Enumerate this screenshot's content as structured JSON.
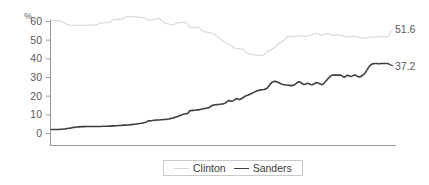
{
  "chart_data": {
    "type": "line",
    "title": "",
    "subtitle": "",
    "xlabel": "",
    "ylabel": "%",
    "ylim": [
      0,
      65
    ],
    "yticks": [
      0,
      10,
      20,
      30,
      40,
      50,
      60
    ],
    "ytick_labels": [
      "0",
      "10",
      "20",
      "30",
      "40",
      "50",
      "60"
    ],
    "xticks": [],
    "xtick_labels": [],
    "grid": false,
    "legend_position": "bottom-center",
    "legend": [
      "Clinton",
      "Sanders"
    ],
    "end_labels": {
      "clinton": "51.6",
      "sanders": "37.2"
    },
    "series": [
      {
        "name": "Clinton",
        "color": "#dcdcdc",
        "end_value": 51.6,
        "values": [
          60.2,
          60.2,
          60.2,
          60.2,
          60.2,
          60.1,
          60.0,
          59.6,
          59.0,
          58.6,
          58.2,
          57.9,
          57.7,
          57.6,
          57.6,
          57.6,
          57.7,
          57.7,
          57.7,
          57.7,
          57.7,
          57.7,
          57.8,
          57.8,
          57.8,
          57.8,
          57.8,
          57.9,
          58.0,
          58.1,
          58.9,
          59.0,
          59.0,
          59.0,
          59.1,
          59.1,
          59.2,
          59.3,
          60.6,
          60.7,
          60.8,
          60.8,
          60.9,
          61.0,
          61.1,
          61.2,
          62.2,
          62.3,
          62.3,
          62.3,
          62.3,
          62.3,
          62.2,
          62.2,
          62.1,
          62.0,
          61.9,
          61.8,
          61.7,
          61.3,
          60.3,
          60.3,
          60.4,
          60.5,
          61.0,
          61.2,
          61.3,
          61.2,
          60.9,
          60.2,
          59.0,
          58.8,
          58.6,
          58.3,
          58.1,
          57.9,
          57.8,
          58.6,
          59.0,
          59.1,
          59.2,
          59.3,
          59.3,
          59.2,
          58.9,
          58.0,
          56.6,
          56.4,
          56.4,
          56.5,
          56.6,
          56.7,
          56.3,
          55.3,
          54.6,
          54.3,
          54.1,
          54.0,
          53.8,
          53.6,
          53.3,
          52.8,
          52.4,
          51.8,
          51.2,
          50.3,
          49.6,
          49.0,
          48.6,
          48.2,
          47.7,
          47.3,
          46.6,
          46.0,
          45.5,
          45.3,
          45.2,
          45.1,
          45.0,
          44.8,
          44.2,
          43.3,
          42.6,
          42.3,
          42.1,
          42.0,
          41.9,
          41.8,
          41.7,
          41.6,
          41.6,
          41.7,
          42.0,
          42.6,
          43.4,
          44.0,
          44.4,
          44.8,
          45.4,
          46.2,
          47.0,
          47.6,
          48.2,
          48.8,
          49.4,
          50.2,
          51.1,
          51.6,
          51.8,
          51.8,
          51.7,
          51.6,
          51.8,
          52.0,
          52.1,
          52.1,
          52.0,
          51.9,
          51.8,
          51.9,
          52.1,
          52.4,
          52.8,
          53.1,
          53.3,
          53.2,
          53.0,
          52.6,
          52.3,
          52.6,
          53.0,
          53.3,
          53.2,
          52.9,
          52.5,
          52.3,
          52.4,
          52.6,
          52.7,
          52.6,
          52.3,
          52.0,
          51.7,
          51.4,
          51.3,
          51.5,
          51.8,
          52.0,
          52.0,
          51.8,
          51.5,
          51.2,
          51.0,
          50.9,
          50.9,
          51.0,
          51.1,
          51.2,
          51.3,
          51.4,
          51.4,
          51.5,
          51.5,
          51.5,
          51.6,
          51.6,
          51.6,
          51.6,
          51.6,
          51.6
        ]
      },
      {
        "name": "Sanders",
        "color": "#3f3f3f",
        "end_value": 37.2,
        "values": [
          1.9,
          1.9,
          1.9,
          1.9,
          1.9,
          1.9,
          2.0,
          2.0,
          2.1,
          2.2,
          2.4,
          2.5,
          2.6,
          2.8,
          3.0,
          3.1,
          3.2,
          3.3,
          3.3,
          3.4,
          3.4,
          3.4,
          3.5,
          3.5,
          3.5,
          3.5,
          3.5,
          3.5,
          3.5,
          3.5,
          3.5,
          3.5,
          3.6,
          3.6,
          3.6,
          3.6,
          3.7,
          3.7,
          3.8,
          3.8,
          3.9,
          3.9,
          4.0,
          4.0,
          4.1,
          4.2,
          4.2,
          4.3,
          4.3,
          4.4,
          4.5,
          4.6,
          4.7,
          4.8,
          5.0,
          5.1,
          5.2,
          5.4,
          5.6,
          5.8,
          6.4,
          6.5,
          6.6,
          6.7,
          6.8,
          6.9,
          7.0,
          7.0,
          7.1,
          7.1,
          7.2,
          7.3,
          7.4,
          7.5,
          7.7,
          7.9,
          8.1,
          8.4,
          8.7,
          9.0,
          9.4,
          9.7,
          10.0,
          10.2,
          10.4,
          10.5,
          11.9,
          12.0,
          12.1,
          12.2,
          12.3,
          12.4,
          12.5,
          12.7,
          12.9,
          13.1,
          13.2,
          13.4,
          13.6,
          14.2,
          14.8,
          15.0,
          15.1,
          15.2,
          15.3,
          15.4,
          15.5,
          15.6,
          16.0,
          16.6,
          17.4,
          17.2,
          17.0,
          17.3,
          17.9,
          18.4,
          18.2,
          17.9,
          18.3,
          18.9,
          19.5,
          19.9,
          20.2,
          20.6,
          21.0,
          21.4,
          21.9,
          22.3,
          22.6,
          22.9,
          23.1,
          23.2,
          23.3,
          23.5,
          24.0,
          25.0,
          26.2,
          27.1,
          27.6,
          27.7,
          27.5,
          27.1,
          26.7,
          26.3,
          26.0,
          25.8,
          25.7,
          25.6,
          25.5,
          25.4,
          25.5,
          25.8,
          26.5,
          27.2,
          27.4,
          27.0,
          26.4,
          26.0,
          26.2,
          26.6,
          26.4,
          26.0,
          25.8,
          26.2,
          26.8,
          27.0,
          26.6,
          26.2,
          25.9,
          26.4,
          27.3,
          28.3,
          29.3,
          30.2,
          30.9,
          31.0,
          31.0,
          31.0,
          31.0,
          31.0,
          30.9,
          30.3,
          29.9,
          30.5,
          30.9,
          30.6,
          30.2,
          30.6,
          31.1,
          30.9,
          30.4,
          30.0,
          30.2,
          30.8,
          31.4,
          32.4,
          33.8,
          35.2,
          36.3,
          36.9,
          37.1,
          37.2,
          37.2,
          37.1,
          37.1,
          37.2,
          37.2,
          37.2,
          37.2,
          37.2
        ]
      }
    ]
  },
  "axis": {
    "unit_label": "%"
  }
}
